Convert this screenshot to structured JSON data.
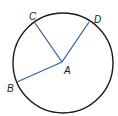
{
  "diagram": {
    "type": "circle-with-radii",
    "circle": {
      "cx": 63,
      "cy": 63,
      "r": 50,
      "stroke": "#1a1a1a"
    },
    "center": {
      "label": "A",
      "x": 62,
      "y": 62
    },
    "segment_color": "#2f63a6",
    "points": [
      {
        "label": "C",
        "x": 35,
        "y": 23,
        "label_x": 29,
        "label_y": 20
      },
      {
        "label": "D",
        "x": 89,
        "y": 22,
        "label_x": 94,
        "label_y": 23
      },
      {
        "label": "B",
        "x": 17,
        "y": 82,
        "label_x": 7,
        "label_y": 92
      }
    ],
    "center_label_pos": {
      "x": 64,
      "y": 74
    }
  }
}
